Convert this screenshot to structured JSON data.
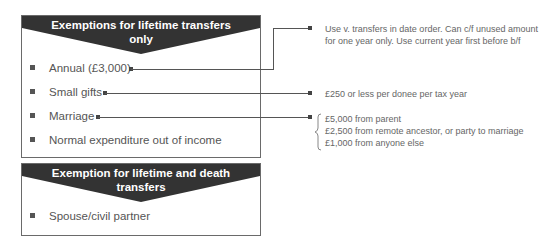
{
  "box1": {
    "title_line1": "Exemptions for lifetime transfers",
    "title_line2": "only",
    "items": [
      {
        "label": "Annual (£3,000)"
      },
      {
        "label": "Small gifts"
      },
      {
        "label": "Marriage"
      },
      {
        "label": "Normal expenditure out of income"
      }
    ]
  },
  "box2": {
    "title_line1": "Exemption for lifetime and death",
    "title_line2": "transfers",
    "items": [
      {
        "label": "Spouse/civil partner"
      }
    ]
  },
  "notes": {
    "annual": {
      "line1": "Use v. transfers in date order. Can c/f unused amount",
      "line2": "for one year only. Use current year first before b/f"
    },
    "small_gifts": {
      "line1": "£250 or less per donee per tax year"
    },
    "marriage": {
      "line1": "£5,000 from parent",
      "line2": "£2,500 from remote ancestor, or party to marriage",
      "line3": "£1,000 from anyone else"
    }
  },
  "colors": {
    "banner": "#333333",
    "border": "#6a6a6a",
    "text": "#555555",
    "line": "#555555"
  }
}
